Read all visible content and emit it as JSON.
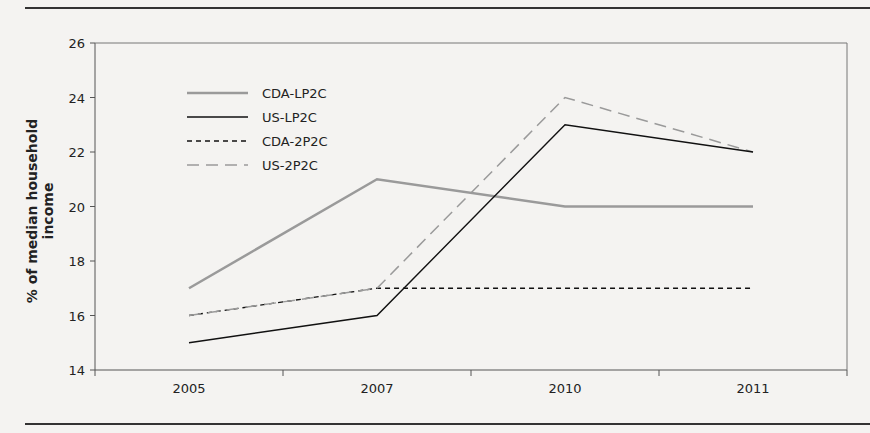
{
  "chart_data": {
    "type": "line",
    "title": "",
    "xlabel": "",
    "ylabel": "% of median household income",
    "categories": [
      "2005",
      "2007",
      "2010",
      "2011"
    ],
    "ylim": [
      14,
      26
    ],
    "yticks": [
      14,
      16,
      18,
      20,
      22,
      24,
      26
    ],
    "grid": false,
    "legend_position": "upper-left",
    "series": [
      {
        "name": "CDA-LP2C",
        "values": [
          17,
          21,
          20,
          20
        ],
        "color": "#9a9a9a",
        "style": "solid-thick"
      },
      {
        "name": "US-LP2C",
        "values": [
          15,
          16,
          23,
          22
        ],
        "color": "#111111",
        "style": "solid"
      },
      {
        "name": "CDA-2P2C",
        "values": [
          16,
          17,
          17,
          17
        ],
        "color": "#111111",
        "style": "short-dash"
      },
      {
        "name": "US-2P2C",
        "values": [
          16,
          17,
          24,
          22
        ],
        "color": "#9a9a9a",
        "style": "long-dash"
      }
    ]
  }
}
